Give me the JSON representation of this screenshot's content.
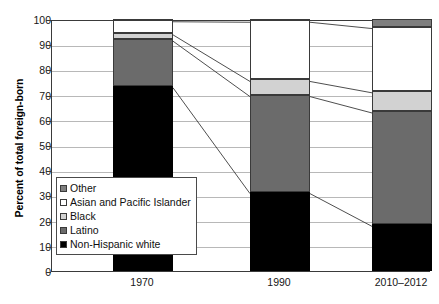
{
  "chart_data": {
    "type": "bar",
    "stacked": true,
    "title": "",
    "subtitle": "",
    "xlabel": "",
    "ylabel": "Percent of total foreign-born",
    "ylim": [
      0,
      100
    ],
    "ytick_step": 10,
    "yticks": [
      0,
      10,
      20,
      30,
      40,
      50,
      60,
      70,
      80,
      90,
      100
    ],
    "ytick_labels": [
      "0",
      "10",
      "20",
      "30",
      "40",
      "50",
      "60",
      "70",
      "80",
      "90",
      "100"
    ],
    "grid": true,
    "legend_position": "inside-lower-left",
    "categories": [
      "1970",
      "1990",
      "2010–2012"
    ],
    "series": [
      {
        "name": "Non-Hispanic white",
        "color": "#000000",
        "values": [
          73.5,
          31.5,
          18.5
        ]
      },
      {
        "name": "Latino",
        "color": "#6b6b6b",
        "values": [
          18.5,
          38.5,
          45.0
        ]
      },
      {
        "name": "Black",
        "color": "#d2d2d2",
        "values": [
          2.5,
          6.0,
          8.0
        ]
      },
      {
        "name": "Asian and Pacific Islander",
        "color": "#ffffff",
        "values": [
          5.2,
          23.5,
          25.5
        ]
      },
      {
        "name": "Other",
        "color": "#7f7f7f",
        "values": [
          0.3,
          0.5,
          3.0
        ]
      }
    ],
    "legend_order": [
      "Other",
      "Asian and Pacific Islander",
      "Black",
      "Latino",
      "Non-Hispanic white"
    ],
    "annotations": "Thin connector lines link matching stack boundaries across adjacent bars."
  },
  "legend": {
    "items": [
      {
        "label": "Other",
        "color": "#7f7f7f"
      },
      {
        "label": "Asian and Pacific Islander",
        "color": "#ffffff"
      },
      {
        "label": "Black",
        "color": "#d2d2d2"
      },
      {
        "label": "Latino",
        "color": "#6b6b6b"
      },
      {
        "label": "Non-Hispanic white",
        "color": "#000000"
      }
    ]
  }
}
